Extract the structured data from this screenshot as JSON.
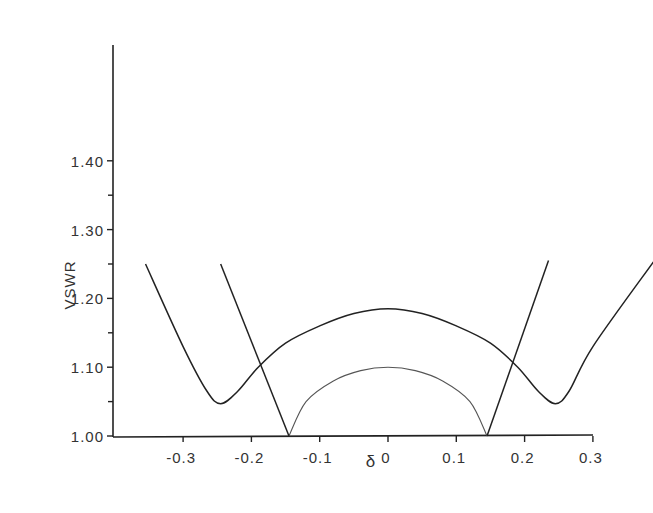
{
  "chart_data": {
    "type": "line",
    "title": "",
    "xlabel": "δ",
    "ylabel": "VSWR",
    "xlim": [
      -0.4,
      0.3
    ],
    "ylim": [
      1.0,
      1.57
    ],
    "grid": false,
    "x_ticks": [
      "-0.3",
      "-0.2",
      "-0.1",
      "0",
      "0.1",
      "0.2",
      "0.3"
    ],
    "y_ticks": [
      "1.00",
      "1.10",
      "1.20",
      "1.30",
      "1.40"
    ],
    "series": [
      {
        "name": "outer curve (double-minimum response)",
        "x": [
          -0.355,
          -0.3,
          -0.265,
          -0.245,
          -0.22,
          -0.19,
          -0.15,
          -0.1,
          -0.05,
          0,
          0.05,
          0.1,
          0.15,
          0.19,
          0.22,
          0.245,
          0.265,
          0.3,
          0.39
        ],
        "y": [
          1.25,
          1.13,
          1.065,
          1.047,
          1.065,
          1.1,
          1.135,
          1.16,
          1.178,
          1.185,
          1.178,
          1.16,
          1.135,
          1.1,
          1.065,
          1.047,
          1.065,
          1.13,
          1.255
        ]
      },
      {
        "name": "inner arc",
        "x": [
          -0.145,
          -0.12,
          -0.08,
          -0.04,
          0,
          0.04,
          0.08,
          0.12,
          0.145
        ],
        "y": [
          1.0,
          1.05,
          1.08,
          1.095,
          1.1,
          1.095,
          1.08,
          1.05,
          1.0
        ]
      },
      {
        "name": "left V line",
        "x": [
          -0.245,
          -0.145
        ],
        "y": [
          1.25,
          1.0
        ]
      },
      {
        "name": "right V line",
        "x": [
          0.145,
          0.235
        ],
        "y": [
          1.0,
          1.255
        ]
      }
    ]
  },
  "axes": {
    "xlabel": "δ",
    "ylabel": "VSWR",
    "x_ticks": [
      "-0.3",
      "-0.2",
      "-0.1",
      "0",
      "0.1",
      "0.2",
      "0.3"
    ],
    "y_ticks": [
      "1.00",
      "1.10",
      "1.20",
      "1.30",
      "1.40"
    ]
  }
}
